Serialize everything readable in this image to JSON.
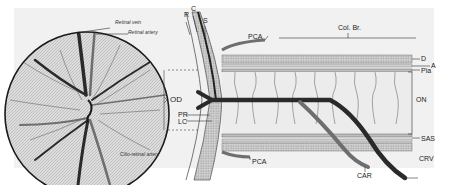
{
  "figure": {
    "type": "anatomical-diagram",
    "fundus_labels": {
      "retinal_vein": "Retinal vein",
      "retinal_artery": "Retinal artery",
      "cilio_retinal_artery": "Cilio-retinal artery"
    },
    "section_labels": {
      "R": "R",
      "C": "C",
      "S": "S",
      "PCA_top": "PCA",
      "PCA_bottom": "PCA",
      "OD": "OD",
      "PR": "PR",
      "LC": "LC",
      "col_br": "Col. Br.",
      "D": "D",
      "A": "A",
      "Pia": "Pia",
      "ON": "ON",
      "SAS": "SAS",
      "CRV": "CRV",
      "CAR": "CAR"
    },
    "colors": {
      "background": "#f1f1f1",
      "vein": "#2a2a2a",
      "artery": "#6e6e6e",
      "outline": "#1a1a1a",
      "sheath": "#bdbdbd"
    }
  }
}
